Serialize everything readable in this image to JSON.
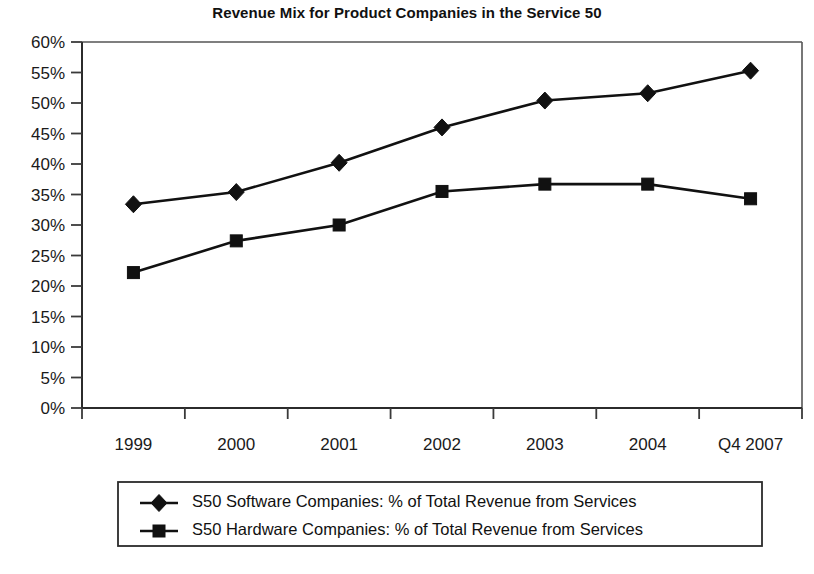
{
  "chart_data": {
    "type": "line",
    "title": "Revenue Mix for Product Companies in the Service 50",
    "xlabel": "",
    "ylabel": "",
    "categories": [
      "1999",
      "2000",
      "2001",
      "2002",
      "2003",
      "2004",
      "Q4 2007"
    ],
    "ylim": [
      0,
      60
    ],
    "ytick_labels": [
      "60%",
      "55%",
      "50%",
      "45%",
      "40%",
      "35%",
      "30%",
      "25%",
      "20%",
      "15%",
      "10%",
      "5%",
      "0%"
    ],
    "ytick_values": [
      60,
      55,
      50,
      45,
      40,
      35,
      30,
      25,
      20,
      15,
      10,
      5,
      0
    ],
    "ytick_step": 5,
    "grid": false,
    "legend_position": "bottom",
    "series": [
      {
        "name": "S50 Software Companies: % of Total Revenue from Services",
        "marker": "diamond",
        "color": "#111111",
        "values": [
          33.4,
          35.4,
          40.2,
          46.0,
          50.4,
          51.6,
          55.3
        ]
      },
      {
        "name": "S50 Hardware Companies: % of Total Revenue from Services",
        "marker": "square",
        "color": "#111111",
        "values": [
          22.2,
          27.4,
          30.0,
          35.5,
          36.7,
          36.7,
          34.3
        ]
      }
    ]
  },
  "legend": {
    "entries": [
      {
        "label": "S50 Software Companies: % of Total Revenue from Services",
        "marker": "diamond"
      },
      {
        "label": "S50 Hardware Companies: % of Total Revenue from Services",
        "marker": "square"
      }
    ]
  },
  "colors": {
    "series": "#111111",
    "axis": "#2b2b2b",
    "frame": "#555555",
    "background": "#ffffff"
  }
}
